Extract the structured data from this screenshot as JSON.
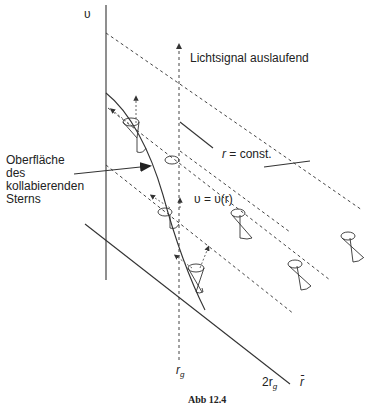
{
  "diagram": {
    "type": "spacetime-diagram",
    "axes": {
      "vertical_label": "υ",
      "horizontal_label": "r̄",
      "rg_label": "r",
      "rg_sub": "g",
      "two_rg_label": "2r",
      "two_rg_sub": "g"
    },
    "labels": {
      "light_signal": "Lichtsignal auslaufend",
      "r_const": "r = const.",
      "r_const_r": "r",
      "r_const_rest": " = const.",
      "v_of_r": "υ = υ(r)",
      "surface_line1": "Oberfläche",
      "surface_line2": "des",
      "surface_line3": "kollabierenden",
      "surface_line4": "Sterns"
    },
    "caption": "Abb 12.4"
  }
}
